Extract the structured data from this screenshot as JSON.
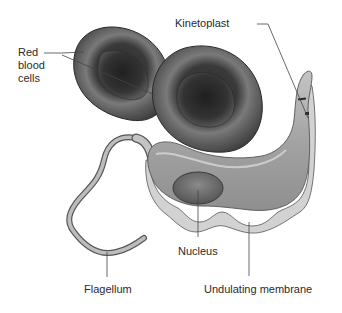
{
  "figure": {
    "colors": {
      "background": "#ffffff",
      "rbc_dark": "#3c3c3c",
      "rbc_mid": "#6a6a6a",
      "rbc_light": "#8a8a8a",
      "body_fill": "#a9a9a9",
      "membrane_fill": "#cfcfcf",
      "nucleus_fill": "#6e6e6e",
      "leader_line": "#444444",
      "label_text": "#2a2a2a"
    }
  },
  "labels": {
    "red_blood_cells": "Red\nblood\ncells",
    "kinetoplast": "Kinetoplast",
    "nucleus": "Nucleus",
    "flagellum": "Flagellum",
    "undulating_membrane": "Undulating membrane"
  }
}
